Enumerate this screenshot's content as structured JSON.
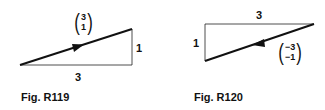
{
  "figures": [
    {
      "caption": "Fig. R119",
      "vector": {
        "top": "3",
        "bottom": "1"
      },
      "horizontal_label": "3",
      "vertical_label": "1"
    },
    {
      "caption": "Fig. R120",
      "vector": {
        "top": "−3",
        "bottom": "−1"
      },
      "horizontal_label": "3",
      "vertical_label": "1"
    }
  ]
}
